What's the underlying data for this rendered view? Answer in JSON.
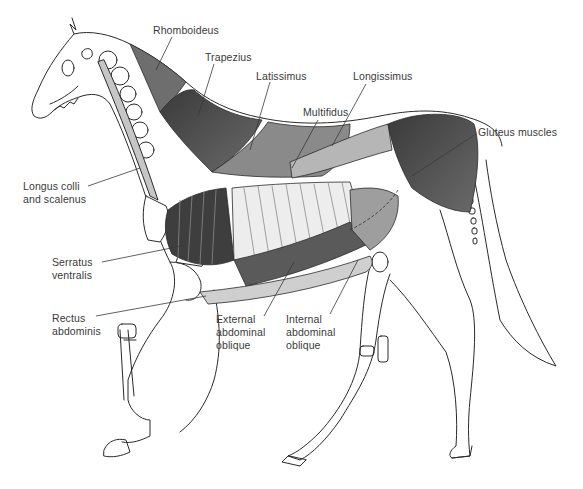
{
  "diagram": {
    "title": "",
    "colors": {
      "outline": "#2a2a2a",
      "muscle_dark": "#4a4a4a",
      "muscle_mid": "#7a7a7a",
      "muscle_light": "#c8c8c8",
      "label_text": "#3a3a3a",
      "background": "#ffffff"
    },
    "labels": [
      {
        "id": "rhomboideus",
        "lines": [
          "Rhomboideus"
        ]
      },
      {
        "id": "trapezius",
        "lines": [
          "Trapezius"
        ]
      },
      {
        "id": "latissimus",
        "lines": [
          "Latissimus"
        ]
      },
      {
        "id": "longissimus",
        "lines": [
          "Longissimus"
        ]
      },
      {
        "id": "multifidus",
        "lines": [
          "Multifidus"
        ]
      },
      {
        "id": "gluteus",
        "lines": [
          "Gluteus muscles"
        ]
      },
      {
        "id": "longus-colli",
        "lines": [
          "Longus colli",
          "and scalenus"
        ]
      },
      {
        "id": "serratus",
        "lines": [
          "Serratus",
          "ventralis"
        ]
      },
      {
        "id": "rectus",
        "lines": [
          "Rectus",
          "abdominis"
        ]
      },
      {
        "id": "external-oblique",
        "lines": [
          "External",
          "abdominal",
          "oblique"
        ]
      },
      {
        "id": "internal-oblique",
        "lines": [
          "Internal",
          "abdominal",
          "oblique"
        ]
      }
    ]
  }
}
